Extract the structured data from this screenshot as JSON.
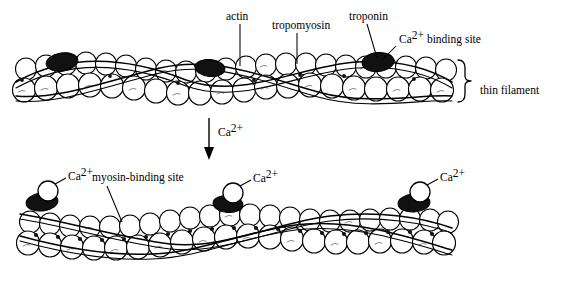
{
  "figure": {
    "title_visible": false,
    "background_color": "#ffffff",
    "ink_color": "#000000"
  },
  "labels": {
    "actin": "actin",
    "tropomyosin": "tropomyosin",
    "troponin": "troponin",
    "ca_binding_site_main": "Ca",
    "ca_binding_site_sup": "2+",
    "ca_binding_site_tail": " binding site",
    "thin_filament": "thin filament",
    "myosin_binding_site": "myosin-binding site",
    "calcium_main": "Ca",
    "calcium_sup": "2+"
  },
  "panels": [
    {
      "id": "relaxed-filament",
      "name": "thin filament (relaxed, tropomyosin blocking)",
      "annotations": [
        "actin",
        "tropomyosin",
        "troponin",
        "Ca2+ binding site",
        "thin filament"
      ]
    },
    {
      "id": "activated-filament",
      "name": "thin filament (Ca2+ bound, myosin-binding sites exposed)",
      "annotations": [
        "myosin-binding site",
        "Ca2+",
        "Ca2+",
        "Ca2+"
      ]
    }
  ],
  "transition": {
    "arrow_label_main": "Ca",
    "arrow_label_sup": "2+",
    "direction": "downward"
  },
  "calcium_markers": [
    {
      "panel": "activated-filament",
      "label_main": "Ca",
      "label_sup": "2+",
      "position": "left"
    },
    {
      "panel": "activated-filament",
      "label_main": "Ca",
      "label_sup": "2+",
      "position": "center"
    },
    {
      "panel": "activated-filament",
      "label_main": "Ca",
      "label_sup": "2+",
      "position": "right"
    }
  ]
}
